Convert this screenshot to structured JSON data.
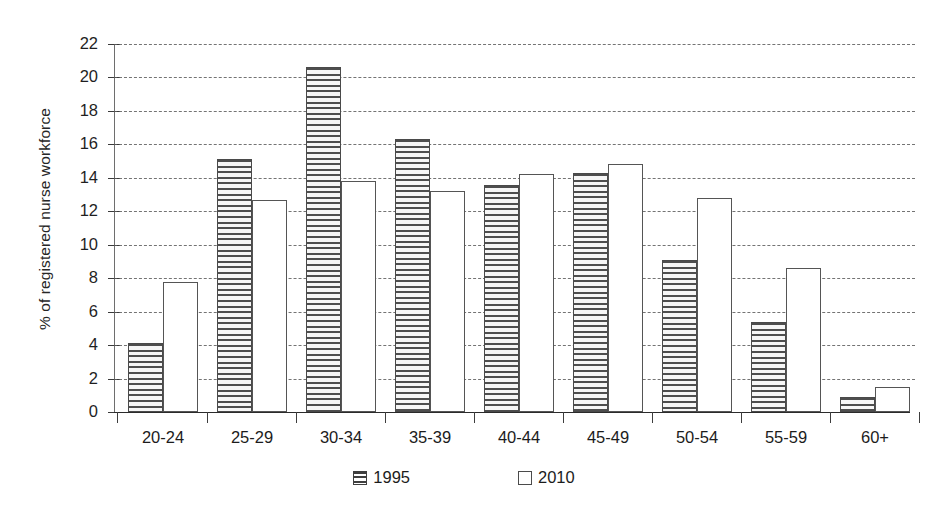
{
  "chart_data": {
    "type": "bar",
    "title": "",
    "subtitle": "",
    "xlabel": "",
    "ylabel": "% of registered nurse workforce",
    "categories": [
      "20-24",
      "25-29",
      "30-34",
      "35-39",
      "40-44",
      "45-49",
      "50-54",
      "55-59",
      "60+"
    ],
    "series": [
      {
        "name": "1995",
        "values": [
          4.1,
          15.1,
          20.6,
          16.3,
          13.6,
          14.3,
          9.1,
          5.4,
          0.9
        ]
      },
      {
        "name": "2010",
        "values": [
          7.8,
          12.7,
          13.8,
          13.2,
          14.2,
          14.8,
          12.8,
          8.6,
          1.5
        ]
      }
    ],
    "ylim": [
      0,
      22
    ],
    "ytick_step": 2,
    "yticks": [
      "22",
      "20",
      "18",
      "16",
      "14",
      "12",
      "10",
      "8",
      "6",
      "4",
      "2",
      "0"
    ],
    "grid": "horizontal-dashed",
    "legend_position": "bottom-center",
    "legend": [
      {
        "label": "1995",
        "swatch": "horizontal-stripes"
      },
      {
        "label": "2010",
        "swatch": "empty-white"
      }
    ]
  }
}
